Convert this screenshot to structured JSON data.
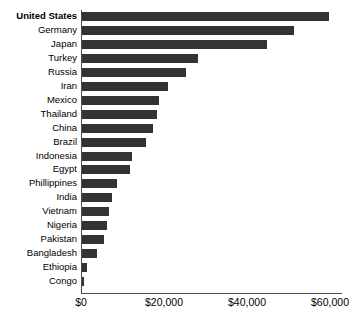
{
  "chart_data": {
    "type": "bar",
    "orientation": "horizontal",
    "title": "",
    "subtitle": "",
    "xlabel": "",
    "ylabel": "",
    "grid": false,
    "legend": null,
    "xlim": [
      0,
      60000
    ],
    "xticks": [
      0,
      20000,
      40000,
      60000
    ],
    "xtick_labels": [
      "$0",
      "$20,000",
      "$40,000",
      "$60,000"
    ],
    "bar_color": "#333333",
    "axis_color": "#4d4d4d",
    "highlight_category": "United States",
    "categories": [
      "United States",
      "Germany",
      "Japan",
      "Turkey",
      "Russia",
      "Iran",
      "Mexico",
      "Thailand",
      "China",
      "Brazil",
      "Indonesia",
      "Egypt",
      "Phillippines",
      "India",
      "Vietnam",
      "Nigeria",
      "Pakistan",
      "Bangladesh",
      "Ethiopia",
      "Congo"
    ],
    "values": [
      59500,
      51000,
      44500,
      28000,
      25000,
      20800,
      18500,
      18000,
      17000,
      15500,
      12000,
      11500,
      8500,
      7200,
      6500,
      6000,
      5200,
      3500,
      1300,
      500
    ]
  }
}
